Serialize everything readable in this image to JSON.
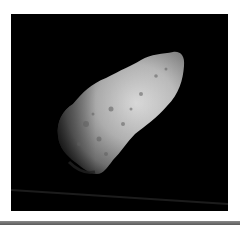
{
  "image": {
    "subject": "asteroid",
    "alt": "Grayscale photograph of an elongated cratered asteroid against black space",
    "background_color": "#000000",
    "border_color": "#ffffff",
    "rule_color": "#6e6e6e"
  }
}
